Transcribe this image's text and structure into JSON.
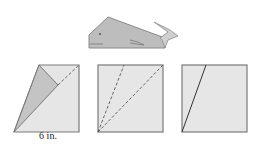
{
  "diagram": {
    "steps": [
      {
        "name": "step-1",
        "description": "square with left flap folded, crease lines"
      },
      {
        "name": "step-2",
        "description": "square with two dashed fold lines from bottom-left corner"
      },
      {
        "name": "step-3",
        "description": "square with one solid fold line from bottom-left"
      }
    ],
    "dimension_label": "6 in.",
    "colors": {
      "paper": "#e6e6e6",
      "flap": "#c4c4c4",
      "whale": "#bdbdbd",
      "stroke": "#7a7a7a",
      "line": "#333333"
    }
  }
}
